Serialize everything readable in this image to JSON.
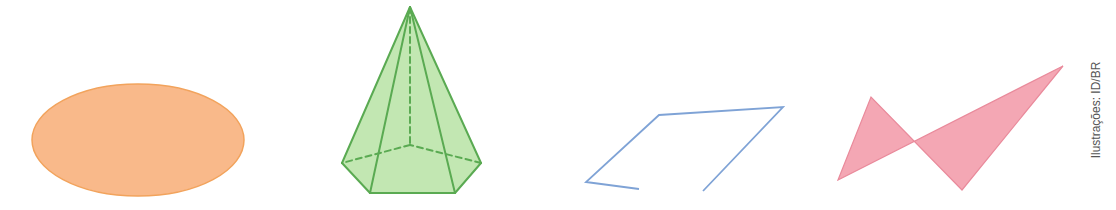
{
  "figures": [
    {
      "id": "ellipse",
      "label": "ellipse",
      "fill": "#f9b98a",
      "stroke": "#f2a35c",
      "cx": 138,
      "cy": 140,
      "rx": 106,
      "ry": 56
    },
    {
      "id": "pyramid",
      "label": "pentagonal pyramid",
      "fill": "#b7e3a4",
      "stroke": "#5aaa52",
      "apex": [
        410,
        7
      ],
      "base": [
        [
          342,
          163
        ],
        [
          370,
          193
        ],
        [
          455,
          193
        ],
        [
          481,
          163
        ],
        [
          410,
          145
        ]
      ],
      "hidden_vertex_index": 4
    },
    {
      "id": "open-polyline",
      "label": "open polygonal line",
      "stroke": "#7fa3d6",
      "points": [
        [
          639,
          189
        ],
        [
          586,
          182
        ],
        [
          659,
          115
        ],
        [
          783,
          107
        ],
        [
          703,
          191
        ]
      ]
    },
    {
      "id": "self-intersecting-polygon",
      "label": "self-intersecting polygon",
      "fill": "#f4a7b4",
      "stroke": "#e98a9b",
      "points": [
        [
          838,
          180
        ],
        [
          871,
          97
        ],
        [
          962,
          190
        ],
        [
          1063,
          66
        ]
      ]
    }
  ],
  "credit": "Ilustrações: ID/BR"
}
